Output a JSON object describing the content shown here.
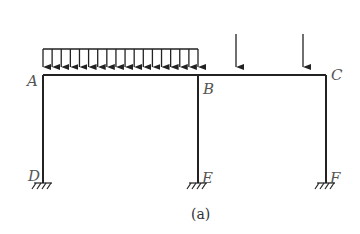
{
  "diagram": {
    "type": "frame-structure",
    "caption": "(a)",
    "nodes": {
      "A": {
        "label": "A",
        "x": 43,
        "y": 75
      },
      "B": {
        "label": "B",
        "x": 198,
        "y": 75
      },
      "C": {
        "label": "C",
        "x": 326,
        "y": 75
      },
      "D": {
        "label": "D",
        "x": 43,
        "y": 183,
        "support": "fixed"
      },
      "E": {
        "label": "E",
        "x": 198,
        "y": 183,
        "support": "fixed"
      },
      "F": {
        "label": "F",
        "x": 326,
        "y": 183,
        "support": "fixed"
      }
    },
    "members": [
      {
        "from": "A",
        "to": "B",
        "kind": "beam"
      },
      {
        "from": "B",
        "to": "C",
        "kind": "beam"
      },
      {
        "from": "A",
        "to": "D",
        "kind": "column"
      },
      {
        "from": "B",
        "to": "E",
        "kind": "column"
      },
      {
        "from": "C",
        "to": "F",
        "kind": "column"
      }
    ],
    "loads": {
      "distributed": {
        "span": "A-B",
        "arrow_count": 18,
        "top_y": 49
      },
      "point_loads": [
        {
          "x": 236,
          "top_y": 34
        },
        {
          "x": 303,
          "top_y": 34
        }
      ]
    },
    "colors": {
      "line": "#222222",
      "label": "#555555"
    }
  }
}
